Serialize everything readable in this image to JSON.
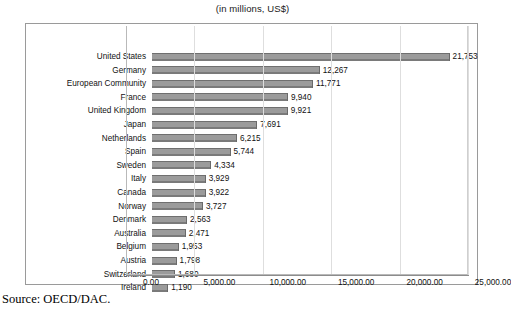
{
  "chart_data": {
    "type": "bar",
    "orientation": "horizontal",
    "title": "(in millions, US$)",
    "xlabel": "",
    "ylabel": "",
    "xlim": [
      0,
      25000
    ],
    "grid": true,
    "legend": null,
    "categories": [
      "United States",
      "Germany",
      "European Community",
      "France",
      "United Kingdom",
      "Japan",
      "Netherlands",
      "Spain",
      "Sweden",
      "Italy",
      "Canada",
      "Norway",
      "Denmark",
      "Australia",
      "Belgium",
      "Austria",
      "Switzerland",
      "Ireland"
    ],
    "values": [
      21753,
      12267,
      11771,
      9940,
      9921,
      7691,
      6215,
      5744,
      4334,
      3929,
      3922,
      3727,
      2563,
      2471,
      1953,
      1798,
      1680,
      1190
    ],
    "value_labels": [
      "21,753",
      "12,267",
      "11,771",
      "9,940",
      "9,921",
      "7,691",
      "6,215",
      "5,744",
      "4,334",
      "3,929",
      "3,922",
      "3,727",
      "2,563",
      "2,471",
      "1,953",
      "1,798",
      "1,680",
      "1,190"
    ],
    "xticks": [
      0,
      5000,
      10000,
      15000,
      20000,
      25000
    ],
    "xtick_labels": [
      "0.00",
      "5,000.00",
      "10,000.00",
      "15,000.00",
      "20,000.00",
      "25,000.00"
    ],
    "bar_color": "#9b9b9b",
    "bar_edge_color": "#6f6f6f",
    "grid_color": "#dedede"
  },
  "footer": {
    "source": "Source: OECD/DAC."
  }
}
